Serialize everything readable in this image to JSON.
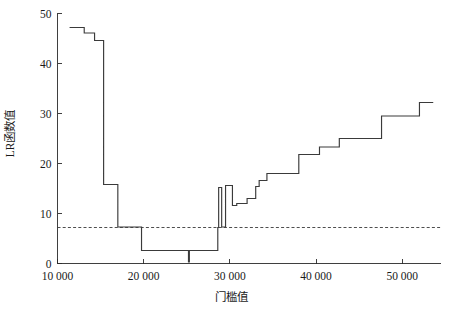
{
  "chart_data": {
    "type": "line",
    "title": "",
    "xlabel": "门槛值",
    "ylabel": "LR函数值",
    "xlim": [
      10000,
      54500
    ],
    "ylim": [
      0,
      50
    ],
    "grid": false,
    "legend": null,
    "xticks": [
      10000,
      20000,
      30000,
      40000,
      50000
    ],
    "xticklabels": [
      "10 000",
      "20 000",
      "30 000",
      "40 000",
      "50 000"
    ],
    "yticks": [
      0,
      10,
      20,
      30,
      40,
      50
    ],
    "yticklabels": [
      "0",
      "10",
      "20",
      "30",
      "40",
      "50"
    ],
    "line_color": "#3a3a3a",
    "threshold_color": "#3a3a3a",
    "annotations": [
      {
        "kind": "horizontal-reference-line",
        "label": "critical value",
        "y": 7.2,
        "style": "dashed"
      }
    ],
    "series": [
      {
        "name": "LR statistic",
        "step": "post",
        "x": [
          11400,
          12000,
          13100,
          13500,
          14300,
          14700,
          15300,
          15350,
          16900,
          17000,
          17350,
          18500,
          19700,
          19750,
          20500,
          22700,
          24900,
          25200,
          25300,
          25450,
          26200,
          28400,
          28600,
          28700,
          29000,
          29050,
          29400,
          29500,
          30200,
          30300,
          30700,
          30800,
          31400,
          32000,
          32600,
          33000,
          33200,
          33400,
          33600,
          34300,
          35300,
          37300,
          38000,
          39600,
          40400,
          41900,
          42700,
          44600,
          45400,
          47600,
          48400,
          51300,
          52000,
          53600
        ],
        "y": [
          47.2,
          47.2,
          46.1,
          46.1,
          44.6,
          44.6,
          44.6,
          15.8,
          15.8,
          7.3,
          7.3,
          7.3,
          7.3,
          2.6,
          2.6,
          2.6,
          2.6,
          0.3,
          2.6,
          2.6,
          2.6,
          2.6,
          7.2,
          15.2,
          15.2,
          7.3,
          7.3,
          15.6,
          15.6,
          11.6,
          11.6,
          12.0,
          12.0,
          13.0,
          13.0,
          15.4,
          15.4,
          16.6,
          16.6,
          18.0,
          18.0,
          18.0,
          21.8,
          21.8,
          23.3,
          23.3,
          25.0,
          25.0,
          25.0,
          29.5,
          29.5,
          29.5,
          32.2,
          32.2
        ]
      }
    ]
  }
}
